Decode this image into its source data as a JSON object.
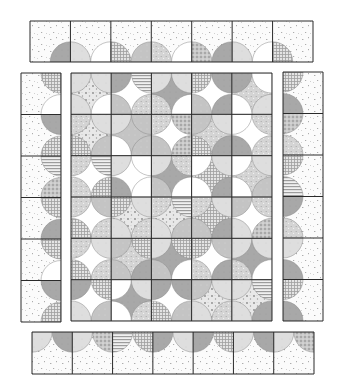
{
  "canvas": {
    "width": 338,
    "height": 390,
    "background": "#ffffff"
  },
  "colors": {
    "outline": "#2a2a2a",
    "background_print": "#fbfbfb",
    "speck": "#9a9a9a",
    "dark_gray": "#a8a8a8",
    "mid_gray": "#c4c4c4",
    "light_gray": "#dedede",
    "very_light": "#eeeeee",
    "white": "#ffffff"
  },
  "fabrics": [
    "specks",
    "dark",
    "mid",
    "light",
    "white",
    "check",
    "stripe",
    "dots",
    "floral",
    "calico"
  ],
  "sections": {
    "top_border": {
      "x": 30,
      "y": 21,
      "w": 283,
      "h": 41,
      "cols": 7,
      "rows": 1,
      "circle_edge": "bottom",
      "edge_fabrics": [
        "dark",
        "light",
        "white",
        "check",
        "mid",
        "calico",
        "white",
        "dots"
      ]
    },
    "left_border": {
      "x": 21,
      "y": 73,
      "w": 40,
      "h": 249,
      "cols": 1,
      "rows": 6,
      "circle_edge": "right",
      "edge_fabrics": [
        "check",
        "white",
        "dark",
        "check",
        "stripe",
        "dots",
        "check",
        "dark"
      ]
    },
    "right_border": {
      "x": 283,
      "y": 72,
      "w": 40,
      "h": 249,
      "cols": 1,
      "rows": 6,
      "circle_edge": "left",
      "edge_fabrics": [
        "check",
        "dark",
        "dots",
        "calico",
        "check",
        "stripe",
        "dark",
        "calico",
        "light",
        "dark"
      ]
    },
    "bottom_border": {
      "x": 32,
      "y": 332,
      "w": 282,
      "h": 42,
      "cols": 7,
      "rows": 1,
      "circle_edge": "top",
      "edge_fabrics": [
        "light",
        "dark",
        "light",
        "dots",
        "stripe",
        "check",
        "dark",
        "light",
        "dark",
        "check"
      ]
    },
    "center": {
      "x": 71,
      "y": 73,
      "w": 201,
      "h": 248,
      "cols": 5,
      "rows": 6,
      "blocks": [
        {
          "bg": "floral",
          "corners": [
            "light",
            "light",
            "white",
            "light"
          ]
        },
        {
          "bg": "white",
          "corners": [
            "dark",
            "stripe",
            "calico",
            "mid"
          ]
        },
        {
          "bg": "dark",
          "corners": [
            "light",
            "light",
            "white",
            "calico"
          ]
        },
        {
          "bg": "white",
          "corners": [
            "check",
            "dark",
            "dark",
            "mid"
          ]
        },
        {
          "bg": "calico",
          "corners": [
            "dark",
            "white",
            "light",
            "white"
          ]
        },
        {
          "bg": "floral",
          "corners": [
            "calico",
            "light",
            "mid",
            "check"
          ]
        },
        {
          "bg": "mid",
          "corners": [
            "light",
            "mid",
            "mid",
            "white"
          ]
        },
        {
          "bg": "white",
          "corners": [
            "calico",
            "dots",
            "dots",
            "mid"
          ]
        },
        {
          "bg": "calico",
          "corners": [
            "mid",
            "light",
            "dark",
            "check"
          ]
        },
        {
          "bg": "white",
          "corners": [
            "white",
            "calico",
            "calico",
            "dark"
          ]
        },
        {
          "bg": "white",
          "corners": [
            "calico",
            "stripe",
            "check",
            "calico"
          ]
        },
        {
          "bg": "white",
          "corners": [
            "light",
            "white",
            "white",
            "dark"
          ]
        },
        {
          "bg": "dark",
          "corners": [
            "light",
            "calico",
            "white",
            "mid"
          ]
        },
        {
          "bg": "check",
          "corners": [
            "white",
            "light",
            "dark",
            "white"
          ]
        },
        {
          "bg": "calico",
          "corners": [
            "white",
            "light",
            "mid",
            "white"
          ]
        },
        {
          "bg": "white",
          "corners": [
            "calico",
            "mid",
            "calico",
            "check"
          ]
        },
        {
          "bg": "floral",
          "corners": [
            "check",
            "light",
            "calico",
            "light"
          ]
        },
        {
          "bg": "floral",
          "corners": [
            "calico",
            "stripe",
            "mid",
            "light"
          ]
        },
        {
          "bg": "check",
          "corners": [
            "calico",
            "light",
            "dark",
            "mid"
          ]
        },
        {
          "bg": "white",
          "corners": [
            "mid",
            "calico",
            "dots",
            "light"
          ]
        },
        {
          "bg": "white",
          "corners": [
            "calico",
            "light",
            "calico",
            "check"
          ]
        },
        {
          "bg": "calico",
          "corners": [
            "mid",
            "check",
            "dark",
            "mid"
          ]
        },
        {
          "bg": "dark",
          "corners": [
            "light",
            "check",
            "white",
            "mid"
          ]
        },
        {
          "bg": "white",
          "corners": [
            "check",
            "mid",
            "dark",
            "calico"
          ]
        },
        {
          "bg": "dark",
          "corners": [
            "light",
            "light",
            "white",
            "calico"
          ]
        },
        {
          "bg": "white",
          "corners": [
            "dark",
            "check",
            "mid",
            "light"
          ]
        },
        {
          "bg": "dark",
          "corners": [
            "white",
            "light",
            "calico",
            "white"
          ]
        },
        {
          "bg": "white",
          "corners": [
            "dark",
            "dark",
            "mid",
            "check"
          ]
        },
        {
          "bg": "floral",
          "corners": [
            "mid",
            "light",
            "calico",
            "light"
          ]
        },
        {
          "bg": "floral",
          "corners": [
            "light",
            "stripe",
            "dark",
            "light"
          ]
        }
      ]
    }
  }
}
